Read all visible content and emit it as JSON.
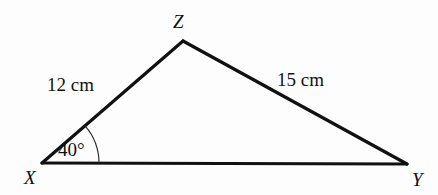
{
  "figure": {
    "type": "triangle-diagram",
    "background_color": "#fdfdfd",
    "stroke_color": "#111111",
    "vertices": [
      {
        "id": "X",
        "label": "X",
        "x": 42,
        "y": 163,
        "label_x": 24,
        "label_y": 184
      },
      {
        "id": "Y",
        "label": "Y",
        "x": 407,
        "y": 164,
        "label_x": 412,
        "label_y": 186
      },
      {
        "id": "Z",
        "label": "Z",
        "x": 183,
        "y": 41,
        "label_x": 173,
        "label_y": 28
      }
    ],
    "sides": [
      {
        "id": "XZ",
        "from": "X",
        "to": "Z",
        "label": "12 cm",
        "label_x": 47,
        "label_y": 91
      },
      {
        "id": "ZY",
        "from": "Z",
        "to": "Y",
        "label": "15 cm",
        "label_x": 277,
        "label_y": 86
      },
      {
        "id": "XY",
        "from": "X",
        "to": "Y",
        "label": "",
        "label_x": 0,
        "label_y": 0
      }
    ],
    "angles": [
      {
        "id": "angle-X",
        "at_vertex": "X",
        "label": "40°",
        "value": 40,
        "unit": "degrees",
        "label_x": 58,
        "label_y": 156,
        "arc_radius": 57
      }
    ]
  }
}
